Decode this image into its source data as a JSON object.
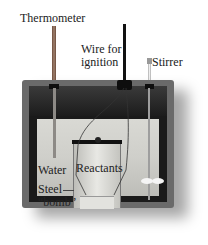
{
  "diagram": {
    "labels": {
      "thermometer": "Thermometer",
      "wire_line1": "Wire for",
      "wire_line2": "ignition",
      "stirrer": "Stirrer",
      "water": "Water",
      "reactants": "Reactants",
      "steel_line1": "Steel",
      "steel_line2": "“bomb”"
    },
    "colors": {
      "container": "#6a6a6a",
      "water": "#d4d4cf",
      "rim": "#1c1c1c",
      "text": "#222222"
    }
  }
}
